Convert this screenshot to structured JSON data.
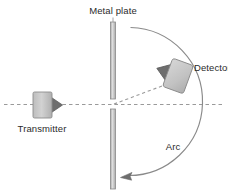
{
  "figure": {
    "title_visible": false,
    "background_color": "#ffffff",
    "labels": {
      "metal_plate": "Metal plate",
      "transmitter": "Transmitter",
      "detector": "Detector",
      "arc": "Arc"
    },
    "colors": {
      "line": "#7a7a7a",
      "line_dark": "#5c5c5c",
      "text": "#2b2b2b",
      "device_body_light": "#c9c9c9",
      "device_body_mid": "#b5b5b5",
      "horn_dark": "#6e6e6e",
      "plate_fill": "#cfcfcf",
      "plate_edge": "#8a8a8a",
      "dashed_axis": "#9a9a9a"
    },
    "elements": {
      "metal_plate": {
        "orientation": "vertical",
        "x": 113,
        "top_segment": {
          "y_start": 22,
          "y_end": 99
        },
        "bottom_segment": {
          "y_start": 109,
          "y_end": 188
        },
        "gap_note": "slit at beam axis"
      },
      "transmitter": {
        "body": {
          "x": 33,
          "y": 92,
          "width": 19,
          "height": 26
        },
        "horn_direction": "right",
        "label_position": "below"
      },
      "detector": {
        "body": {
          "cx": 178,
          "cy": 76,
          "width": 22,
          "height": 30,
          "rotation_deg": 20
        },
        "horn_direction": "down-left",
        "label_position": "right"
      },
      "beam_axis": {
        "type": "dashed-horizontal",
        "y": 104,
        "x_start": 4,
        "x_end": 224
      },
      "diffracted_ray": {
        "type": "dashed-diagonal",
        "from": [
          113,
          104
        ],
        "to": [
          170,
          84
        ]
      },
      "arc": {
        "type": "circular-arc-with-arrow",
        "center": [
          113,
          104
        ],
        "radius": 62,
        "start": [
          130,
          28
        ],
        "end": [
          125,
          177
        ],
        "arrowheads": [
          "end-bottom-left"
        ],
        "label_position": "inside-lower-right"
      }
    }
  }
}
